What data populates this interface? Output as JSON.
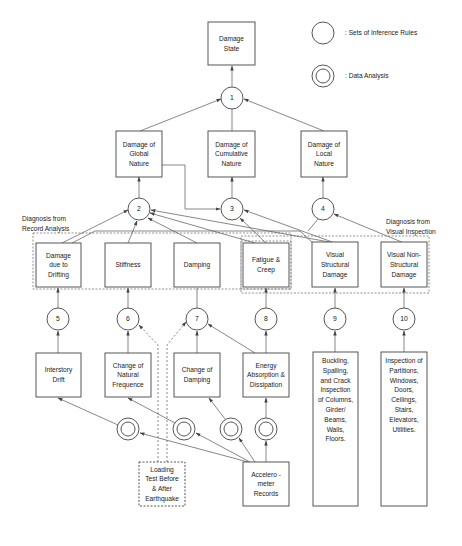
{
  "legend": {
    "inference_rules": ": Sets of Inference Rules",
    "data_analysis": ": Data Analysis"
  },
  "group_labels": {
    "record_analysis": [
      "Diagnosis from",
      "Record Analysis"
    ],
    "visual_inspection": [
      "Diagnosis from",
      "Visual Inspection"
    ]
  },
  "nodes": {
    "damage_state": [
      "Damage",
      "State"
    ],
    "global": [
      "Damage of",
      "Global",
      "Nature"
    ],
    "cumulative": [
      "Damage of",
      "Cumulative",
      "Nature"
    ],
    "local": [
      "Damage of",
      "Local",
      "Nature"
    ],
    "drifting": [
      "Damage",
      "due to",
      "Drifting"
    ],
    "stiffness": [
      "Stiffness"
    ],
    "damping": [
      "Damping"
    ],
    "fatigue": [
      "Fatigue &",
      "Creep"
    ],
    "visual_structural": [
      "Visual",
      "Structural",
      "Damage"
    ],
    "visual_nonstructural": [
      "Visual Non-",
      "Structural",
      "Damage"
    ],
    "interstory": [
      "Interstory",
      "Drift"
    ],
    "natural_freq": [
      "Change of",
      "Natural",
      "Frequence"
    ],
    "change_damping": [
      "Change of",
      "Damping"
    ],
    "energy": [
      "Energy",
      "Absorption &",
      "Dissipation"
    ],
    "buckling": [
      "Buckling,",
      "Spalling,",
      "and Crack",
      "Inspection",
      "of Columns,",
      "Girder/",
      "Beams,",
      "Walls,",
      "Floors."
    ],
    "inspection": [
      "Inspection of",
      "Partitions,",
      "Windows,",
      "Doors,",
      "Ceilings,",
      "Stairs,",
      "Elevators,",
      "Utilities."
    ],
    "loading": [
      "Loading",
      "Test Before",
      "& After",
      "Earthquake"
    ],
    "accelerometer": [
      "Accelero -",
      "meter",
      "Records"
    ]
  },
  "rules": [
    "1",
    "2",
    "3",
    "4",
    "5",
    "6",
    "7",
    "8",
    "9",
    "10"
  ]
}
